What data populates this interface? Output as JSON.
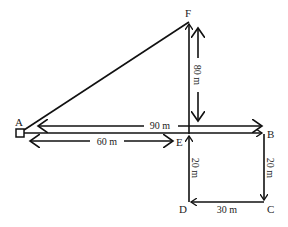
{
  "diagram": {
    "type": "displacement-path",
    "points": {
      "A": {
        "label": "A",
        "x": 20,
        "y": 133
      },
      "B": {
        "label": "B",
        "x": 264,
        "y": 134
      },
      "C": {
        "label": "C",
        "x": 264,
        "y": 202
      },
      "D": {
        "label": "D",
        "x": 189,
        "y": 202
      },
      "E": {
        "label": "E",
        "x": 189,
        "y": 134
      },
      "F": {
        "label": "F",
        "x": 189,
        "y": 22
      }
    },
    "segments": [
      {
        "from": "A",
        "to": "B"
      },
      {
        "from": "B",
        "to": "C"
      },
      {
        "from": "C",
        "to": "D"
      },
      {
        "from": "D",
        "to": "E"
      },
      {
        "from": "E",
        "to": "F"
      },
      {
        "from": "F",
        "to": "A"
      }
    ],
    "dimensions": {
      "AB": "90 m",
      "AE": "60 m",
      "EF": "80 m",
      "ED": "20 m",
      "BC": "20 m",
      "DC": "30 m"
    },
    "colors": {
      "line": "#111111",
      "background": "#ffffff"
    }
  }
}
